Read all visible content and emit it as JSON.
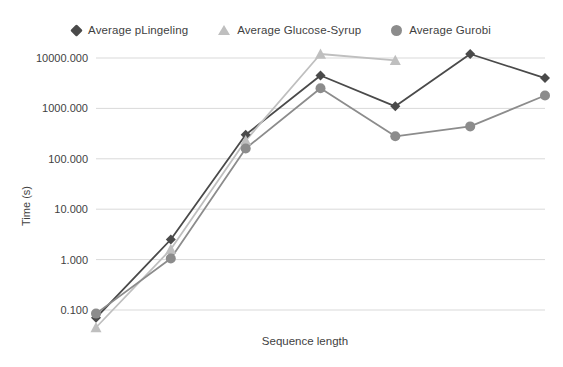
{
  "legend": {
    "position": "top-center",
    "items": [
      {
        "label": "Average pLingeling",
        "marker": "diamond",
        "color": "#4a4a4a"
      },
      {
        "label": "Average Glucose-Syrup",
        "marker": "triangle",
        "color": "#bfbfbf"
      },
      {
        "label": "Average Gurobi",
        "marker": "circle",
        "color": "#8c8c8c"
      }
    ]
  },
  "chart_data": {
    "type": "line",
    "title": "",
    "xlabel": "Sequence length",
    "ylabel": "Time (s)",
    "yscale": "log",
    "ylim": [
      0.1,
      10000
    ],
    "ytick_labels": [
      "10000.000",
      "1000.000",
      "100.000",
      "10.000",
      "1.000",
      "0.100"
    ],
    "ytick_values": [
      10000,
      1000,
      100,
      10,
      1,
      0.1
    ],
    "xtick_labels": [],
    "grid": "horizontal",
    "x": [
      1,
      2,
      3,
      4,
      5,
      6,
      7
    ],
    "series": [
      {
        "name": "Average pLingeling",
        "marker": "diamond",
        "color": "#4a4a4a",
        "values": [
          0.07,
          2.5,
          300,
          4500,
          1100,
          12000,
          4000
        ]
      },
      {
        "name": "Average Glucose-Syrup",
        "marker": "triangle",
        "color": "#bfbfbf",
        "values": [
          0.045,
          1.6,
          230,
          12000,
          9000,
          null,
          null
        ]
      },
      {
        "name": "Average Gurobi",
        "marker": "circle",
        "color": "#8c8c8c",
        "values": [
          0.085,
          1.05,
          160,
          2500,
          280,
          440,
          1800
        ]
      }
    ]
  },
  "colors": {
    "background": "#ffffff",
    "grid": "#d9d9d9",
    "text": "#3f3f3f"
  }
}
